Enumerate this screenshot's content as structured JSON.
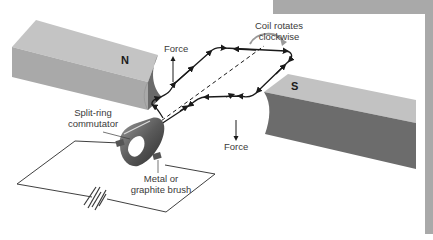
{
  "diagram": {
    "magnets": {
      "north_label": "N",
      "south_label": "S"
    },
    "labels": {
      "force_top": "Force",
      "force_bottom": "Force",
      "rotation_line1": "Coil rotates",
      "rotation_line2": "clockwise",
      "commutator_line1": "Split-ring",
      "commutator_line2": "commutator",
      "brush_line1": "Metal or",
      "brush_line2": "graphite brush"
    },
    "colors": {
      "magnet_top": "#bdbdbd",
      "magnet_side": "#a6a6a6",
      "magnet_face_dark": "#6f6f6f",
      "wire": "#1a1a1a",
      "frame_gray": "#a9a9a9",
      "background": "#ffffff"
    }
  }
}
